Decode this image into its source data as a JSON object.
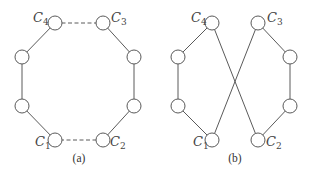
{
  "figure": {
    "panels": [
      {
        "caption": "(a)",
        "labels": {
          "c1": "C",
          "c1_sub": "1",
          "c2": "C",
          "c2_sub": "2",
          "c3": "C",
          "c3_sub": "3",
          "c4": "C",
          "c4_sub": "4"
        },
        "description": "Octagonal ring of 8 nodes; edges C4-C3 and C1-C2 dashed"
      },
      {
        "caption": "(b)",
        "labels": {
          "c1": "C",
          "c1_sub": "1",
          "c2": "C",
          "c2_sub": "2",
          "c3": "C",
          "c3_sub": "3",
          "c4": "C",
          "c4_sub": "4"
        },
        "description": "Ring reconnected: C4-C2 and C3-C1 crossing edges form a figure-eight"
      }
    ]
  }
}
